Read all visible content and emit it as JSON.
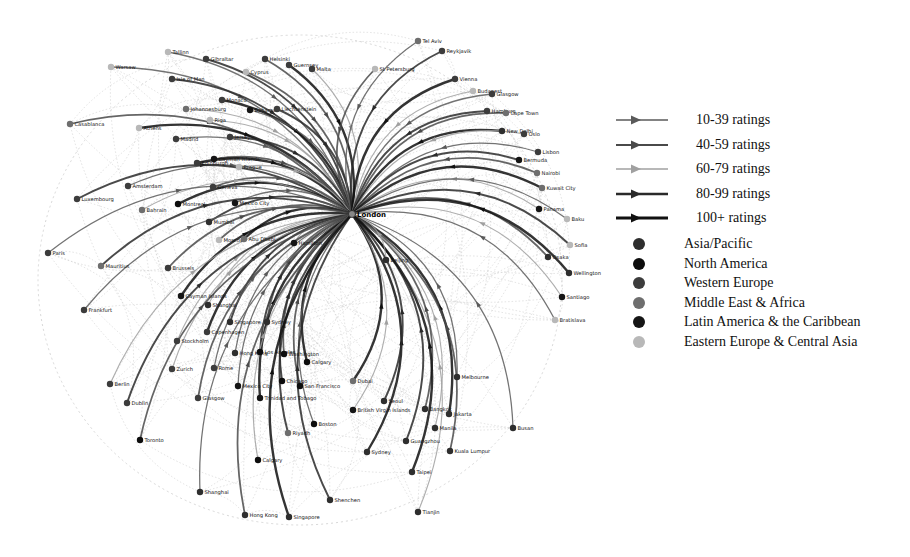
{
  "diagram": {
    "title": "",
    "hub": {
      "name": "London",
      "x": 352,
      "y": 214
    },
    "legend": {
      "ratings": [
        {
          "label": "10-39 ratings",
          "color": "#5a5a5a",
          "width": 1.6
        },
        {
          "label": "40-59 ratings",
          "color": "#4a4a4a",
          "width": 2.2
        },
        {
          "label": "60-79 ratings",
          "color": "#a0a0a0",
          "width": 1.4
        },
        {
          "label": "80-99 ratings",
          "color": "#2a2a2a",
          "width": 2.4
        },
        {
          "label": "100+ ratings",
          "color": "#111111",
          "width": 3
        }
      ],
      "regions": [
        {
          "label": "Asia/Pacific",
          "color": "#2e2e2e"
        },
        {
          "label": "North America",
          "color": "#0d0d0d"
        },
        {
          "label": "Western Europe",
          "color": "#3c3c3c"
        },
        {
          "label": "Middle East & Africa",
          "color": "#6e6e6e"
        },
        {
          "label": "Latin America & the Caribbean",
          "color": "#151515"
        },
        {
          "label": "Eastern Europe & Central Asia",
          "color": "#b8b8b8"
        }
      ]
    },
    "nodes": [
      {
        "name": "Tallinn",
        "x": 168,
        "y": 52,
        "region": "Eastern Europe & Central Asia"
      },
      {
        "name": "Gibraltar",
        "x": 206,
        "y": 59,
        "region": "Western Europe"
      },
      {
        "name": "Helsinki",
        "x": 265,
        "y": 59,
        "region": "Western Europe"
      },
      {
        "name": "Guernsey",
        "x": 289,
        "y": 65,
        "region": "Western Europe"
      },
      {
        "name": "Malta",
        "x": 312,
        "y": 69,
        "region": "Western Europe"
      },
      {
        "name": "Warsaw",
        "x": 111,
        "y": 67,
        "region": "Eastern Europe & Central Asia"
      },
      {
        "name": "Isle of Man",
        "x": 172,
        "y": 79,
        "region": "Western Europe"
      },
      {
        "name": "Cyprus",
        "x": 246,
        "y": 72,
        "region": "Eastern Europe & Central Asia"
      },
      {
        "name": "Monaco",
        "x": 222,
        "y": 100,
        "region": "Western Europe"
      },
      {
        "name": "Johannesburg",
        "x": 186,
        "y": 109,
        "region": "Middle East & Africa"
      },
      {
        "name": "Bahamas",
        "x": 250,
        "y": 110,
        "region": "Latin America & the Caribbean"
      },
      {
        "name": "Liechtenstein",
        "x": 277,
        "y": 109,
        "region": "Western Europe"
      },
      {
        "name": "Casablanca",
        "x": 70,
        "y": 124,
        "region": "Middle East & Africa"
      },
      {
        "name": "Athens",
        "x": 139,
        "y": 128,
        "region": "Eastern Europe & Central Asia"
      },
      {
        "name": "Riga",
        "x": 210,
        "y": 120,
        "region": "Eastern Europe & Central Asia"
      },
      {
        "name": "Madrid",
        "x": 176,
        "y": 139,
        "region": "Western Europe"
      },
      {
        "name": "Jersey",
        "x": 230,
        "y": 137,
        "region": "Western Europe"
      },
      {
        "name": "Cayman Islands",
        "x": 214,
        "y": 159,
        "region": "Latin America & the Caribbean"
      },
      {
        "name": "Edinburgh",
        "x": 197,
        "y": 163,
        "region": "Western Europe"
      },
      {
        "name": "Prague",
        "x": 239,
        "y": 167,
        "region": "Eastern Europe & Central Asia"
      },
      {
        "name": "Amsterdam",
        "x": 128,
        "y": 186,
        "region": "Western Europe"
      },
      {
        "name": "Luxembourg",
        "x": 77,
        "y": 199,
        "region": "Western Europe"
      },
      {
        "name": "Geneva",
        "x": 213,
        "y": 187,
        "region": "Western Europe"
      },
      {
        "name": "Montreal",
        "x": 178,
        "y": 204,
        "region": "North America"
      },
      {
        "name": "Bahrain",
        "x": 142,
        "y": 210,
        "region": "Middle East & Africa"
      },
      {
        "name": "Mexico City",
        "x": 235,
        "y": 203,
        "region": "Latin America & the Caribbean"
      },
      {
        "name": "Mumbai",
        "x": 209,
        "y": 222,
        "region": "Asia/Pacific"
      },
      {
        "name": "Moscow",
        "x": 219,
        "y": 240,
        "region": "Eastern Europe & Central Asia"
      },
      {
        "name": "Abu Dhabi",
        "x": 244,
        "y": 239,
        "region": "Middle East & Africa"
      },
      {
        "name": "Hamilton",
        "x": 294,
        "y": 243,
        "region": "Latin America & the Caribbean"
      },
      {
        "name": "Paris",
        "x": 48,
        "y": 253,
        "region": "Western Europe"
      },
      {
        "name": "Mauritius",
        "x": 101,
        "y": 266,
        "region": "Middle East & Africa"
      },
      {
        "name": "Brussels",
        "x": 168,
        "y": 268,
        "region": "Western Europe"
      },
      {
        "name": "Cayman Islands ",
        "x": 181,
        "y": 296,
        "region": "Latin America & the Caribbean"
      },
      {
        "name": "Shanghai ",
        "x": 208,
        "y": 305,
        "region": "Asia/Pacific"
      },
      {
        "name": "Frankfurt",
        "x": 84,
        "y": 310,
        "region": "Western Europe"
      },
      {
        "name": "Singapore ",
        "x": 230,
        "y": 322,
        "region": "Asia/Pacific"
      },
      {
        "name": "Sydney ",
        "x": 267,
        "y": 322,
        "region": "Asia/Pacific"
      },
      {
        "name": "Copenhagen",
        "x": 207,
        "y": 332,
        "region": "Western Europe"
      },
      {
        "name": "Stockholm",
        "x": 177,
        "y": 341,
        "region": "Western Europe"
      },
      {
        "name": "Hong Kong ",
        "x": 235,
        "y": 353,
        "region": "Asia/Pacific"
      },
      {
        "name": "Los Angeles",
        "x": 260,
        "y": 352,
        "region": "North America"
      },
      {
        "name": "Washington",
        "x": 284,
        "y": 354,
        "region": "North America"
      },
      {
        "name": "Calgary ",
        "x": 307,
        "y": 362,
        "region": "North America"
      },
      {
        "name": "Zurich",
        "x": 172,
        "y": 369,
        "region": "Western Europe"
      },
      {
        "name": "Rome",
        "x": 214,
        "y": 368,
        "region": "Western Europe"
      },
      {
        "name": "Chicago",
        "x": 282,
        "y": 381,
        "region": "North America"
      },
      {
        "name": "San Francisco",
        "x": 300,
        "y": 386,
        "region": "North America"
      },
      {
        "name": "Dubai",
        "x": 353,
        "y": 381,
        "region": "Middle East & Africa"
      },
      {
        "name": "Berlin",
        "x": 110,
        "y": 384,
        "region": "Western Europe"
      },
      {
        "name": "Mexico City ",
        "x": 238,
        "y": 386,
        "region": "Latin America & the Caribbean"
      },
      {
        "name": "Dublin",
        "x": 127,
        "y": 403,
        "region": "Western Europe"
      },
      {
        "name": "Glasgow",
        "x": 198,
        "y": 398,
        "region": "Western Europe"
      },
      {
        "name": "Trinidad and Tobago",
        "x": 260,
        "y": 398,
        "region": "Latin America & the Caribbean"
      },
      {
        "name": "British Virgin Islands",
        "x": 353,
        "y": 410,
        "region": "Latin America & the Caribbean"
      },
      {
        "name": "Boston",
        "x": 314,
        "y": 424,
        "region": "North America"
      },
      {
        "name": "Riyadh",
        "x": 288,
        "y": 433,
        "region": "Middle East & Africa"
      },
      {
        "name": "Toronto",
        "x": 140,
        "y": 440,
        "region": "North America"
      },
      {
        "name": "Sydney",
        "x": 367,
        "y": 452,
        "region": "Asia/Pacific"
      },
      {
        "name": "Calgary",
        "x": 258,
        "y": 460,
        "region": "North America"
      },
      {
        "name": "Shanghai",
        "x": 200,
        "y": 492,
        "region": "Asia/Pacific"
      },
      {
        "name": "Shenchen",
        "x": 330,
        "y": 500,
        "region": "Asia/Pacific"
      },
      {
        "name": "Hong Kong",
        "x": 245,
        "y": 515,
        "region": "Asia/Pacific"
      },
      {
        "name": "Singapore",
        "x": 289,
        "y": 517,
        "region": "Asia/Pacific"
      },
      {
        "name": "Tianjin",
        "x": 418,
        "y": 512,
        "region": "Asia/Pacific"
      },
      {
        "name": "Melbourne",
        "x": 457,
        "y": 377,
        "region": "Asia/Pacific"
      },
      {
        "name": "Seoul",
        "x": 384,
        "y": 401,
        "region": "Asia/Pacific"
      },
      {
        "name": "Bangkok",
        "x": 425,
        "y": 409,
        "region": "Asia/Pacific"
      },
      {
        "name": "Jakarta",
        "x": 449,
        "y": 414,
        "region": "Asia/Pacific"
      },
      {
        "name": "Manila",
        "x": 435,
        "y": 428,
        "region": "Asia/Pacific"
      },
      {
        "name": "Busan",
        "x": 513,
        "y": 428,
        "region": "Asia/Pacific"
      },
      {
        "name": "Guangzhou",
        "x": 406,
        "y": 441,
        "region": "Asia/Pacific"
      },
      {
        "name": "Kuala Lumpur",
        "x": 450,
        "y": 451,
        "region": "Asia/Pacific"
      },
      {
        "name": "Taipei",
        "x": 412,
        "y": 472,
        "region": "Asia/Pacific"
      },
      {
        "name": "Beijing",
        "x": 386,
        "y": 260,
        "region": "Asia/Pacific"
      },
      {
        "name": "Tel Aviv",
        "x": 418,
        "y": 41,
        "region": "Middle East & Africa"
      },
      {
        "name": "Reykjavik",
        "x": 442,
        "y": 51,
        "region": "Western Europe"
      },
      {
        "name": "St Petersburg",
        "x": 375,
        "y": 69,
        "region": "Eastern Europe & Central Asia"
      },
      {
        "name": "Vienna",
        "x": 455,
        "y": 79,
        "region": "Western Europe"
      },
      {
        "name": "Budapest",
        "x": 473,
        "y": 91,
        "region": "Eastern Europe & Central Asia"
      },
      {
        "name": "Glasgow ",
        "x": 492,
        "y": 94,
        "region": "Western Europe"
      },
      {
        "name": "Hamburg",
        "x": 487,
        "y": 111,
        "region": "Western Europe"
      },
      {
        "name": "Cape Town",
        "x": 506,
        "y": 113,
        "region": "Middle East & Africa"
      },
      {
        "name": "New Delhi",
        "x": 502,
        "y": 131,
        "region": "Asia/Pacific"
      },
      {
        "name": "Oslo",
        "x": 524,
        "y": 134,
        "region": "Western Europe"
      },
      {
        "name": "Lisbon",
        "x": 538,
        "y": 152,
        "region": "Western Europe"
      },
      {
        "name": "Bermuda",
        "x": 519,
        "y": 160,
        "region": "Latin America & the Caribbean"
      },
      {
        "name": "Nairobi",
        "x": 537,
        "y": 173,
        "region": "Middle East & Africa"
      },
      {
        "name": "Kuwait City",
        "x": 542,
        "y": 188,
        "region": "Middle East & Africa"
      },
      {
        "name": "Panama",
        "x": 539,
        "y": 209,
        "region": "Latin America & the Caribbean"
      },
      {
        "name": "Baku",
        "x": 567,
        "y": 219,
        "region": "Eastern Europe & Central Asia"
      },
      {
        "name": "Sofia",
        "x": 570,
        "y": 245,
        "region": "Eastern Europe & Central Asia"
      },
      {
        "name": "Osaka",
        "x": 548,
        "y": 257,
        "region": "Asia/Pacific"
      },
      {
        "name": "Wellington",
        "x": 569,
        "y": 273,
        "region": "Asia/Pacific"
      },
      {
        "name": "Santiago",
        "x": 562,
        "y": 297,
        "region": "Latin America & the Caribbean"
      },
      {
        "name": "Bratislava",
        "x": 555,
        "y": 320,
        "region": "Eastern Europe & Central Asia"
      }
    ]
  }
}
